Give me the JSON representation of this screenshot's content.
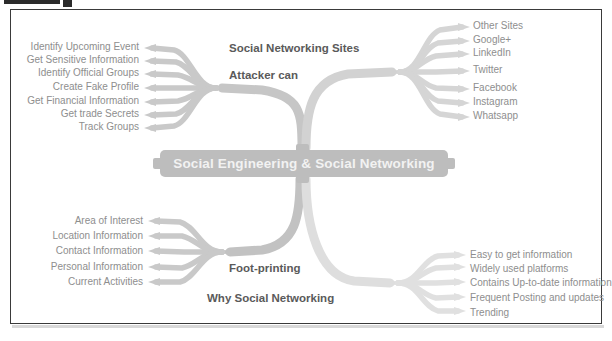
{
  "figure": {
    "root": {
      "label": "Social Engineering & Social Networking"
    },
    "branches": [
      {
        "id": "attacker-can",
        "label": "Attacker can",
        "position": "top-left",
        "leaves": [
          "Identify Upcoming Event",
          "Get Sensitive Information",
          "Identify Official Groups",
          "Create Fake Profile",
          "Get Financial Information",
          "Get trade Secrets",
          "Track Groups"
        ]
      },
      {
        "id": "social-networking-sites",
        "label": "Social Networking Sites",
        "position": "top-right",
        "leaves": [
          "Other Sites",
          "Google+",
          "LinkedIn",
          "Twitter",
          "Facebook",
          "Instagram",
          "Whatsapp"
        ]
      },
      {
        "id": "foot-printing",
        "label": "Foot-printing",
        "position": "bottom-left",
        "leaves": [
          "Area of Interest",
          "Location Information",
          "Contact Information",
          "Personal Information",
          "Current Activities"
        ]
      },
      {
        "id": "why-social-networking",
        "label": "Why Social Networking",
        "position": "bottom-right",
        "leaves": [
          "Easy to get information",
          "Widely used platforms",
          "Contains Up-to-date information",
          "Frequent Posting and updates",
          "Trending"
        ]
      }
    ],
    "colors": {
      "root_fill": "#bdbdbd",
      "root_text": "#f2f2f2",
      "branch_label_text": "#5a5a5a",
      "leaf_text": "#8e8e8e",
      "wire_dark": "#b4b4b4",
      "wire_light": "#dcdcdc",
      "frame_border": "#3a3a3a",
      "background": "#ffffff"
    }
  }
}
